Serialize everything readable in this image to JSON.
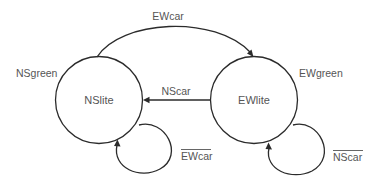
{
  "diagram": {
    "type": "state-transition",
    "colors": {
      "stroke": "#2b2b2b",
      "text": "#555555",
      "background": "#ffffff"
    },
    "states": [
      {
        "id": "NSlite",
        "label": "NSlite",
        "output_label": "NSgreen"
      },
      {
        "id": "EWlite",
        "label": "EWlite",
        "output_label": "EWgreen"
      }
    ],
    "transitions": [
      {
        "from": "NSlite",
        "to": "EWlite",
        "label": "EWcar",
        "negated": false
      },
      {
        "from": "EWlite",
        "to": "NSlite",
        "label": "NScar",
        "negated": false
      },
      {
        "from": "NSlite",
        "to": "NSlite",
        "label": "EWcar",
        "negated": true
      },
      {
        "from": "EWlite",
        "to": "EWlite",
        "label": "NScar",
        "negated": true
      }
    ]
  }
}
